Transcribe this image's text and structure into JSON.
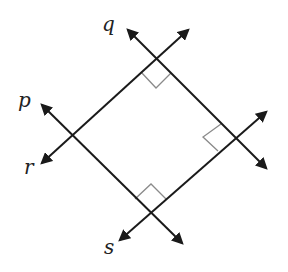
{
  "diagram": {
    "type": "perpendicular-lines",
    "labels": {
      "p": "p",
      "q": "q",
      "r": "r",
      "s": "s"
    },
    "colors": {
      "line": "#1a1a1a",
      "right_angle_mark": "#8a8a8a",
      "background": "#ffffff"
    },
    "right_angles": 3
  }
}
